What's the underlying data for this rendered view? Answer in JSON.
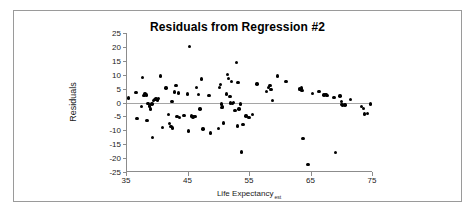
{
  "figure": {
    "title": "Residuals from Regression #2",
    "background": "#ffffff",
    "border_color": "#9a9a9a"
  },
  "chart_data": {
    "type": "scatter",
    "title": "Residuals from Regression #2",
    "xlabel": "Life Expectancy",
    "xlabel_subscript": "est",
    "ylabel": "Residuals",
    "xlim": [
      35,
      75
    ],
    "ylim": [
      -25,
      25
    ],
    "xticks": [
      35,
      45,
      55,
      65,
      75
    ],
    "yticks": [
      25,
      20,
      15,
      10,
      5,
      0,
      -5,
      -10,
      -15,
      -20,
      -25
    ],
    "xtick_labels": [
      "35",
      "45",
      "55",
      "65",
      "75"
    ],
    "ytick_labels": [
      "25",
      "20",
      "15",
      "10",
      "5",
      "0",
      "-5",
      "-10",
      "-15",
      "-20",
      "-25"
    ],
    "grid": false,
    "zero_line": true,
    "legend": null,
    "marker": "filled-circle",
    "marker_color": "#000000",
    "points": [
      [
        35.4,
        1.6
      ],
      [
        36.6,
        3.7
      ],
      [
        36.8,
        -5.8
      ],
      [
        37.5,
        -1.5
      ],
      [
        37.7,
        8.9
      ],
      [
        37.9,
        2.6
      ],
      [
        38.1,
        3.0
      ],
      [
        38.3,
        2.7
      ],
      [
        38.4,
        -6.4
      ],
      [
        38.6,
        -0.3
      ],
      [
        38.8,
        -1.2
      ],
      [
        39.0,
        -2.4
      ],
      [
        39.2,
        -0.6
      ],
      [
        39.3,
        -12.5
      ],
      [
        39.5,
        0.8
      ],
      [
        39.7,
        1.1
      ],
      [
        39.9,
        1.3
      ],
      [
        40.1,
        0.9
      ],
      [
        40.3,
        1.4
      ],
      [
        40.6,
        9.6
      ],
      [
        40.9,
        -8.9
      ],
      [
        41.5,
        5.2
      ],
      [
        41.9,
        -4.3
      ],
      [
        42.1,
        -7.6
      ],
      [
        42.3,
        -8.6
      ],
      [
        42.5,
        0.3
      ],
      [
        42.6,
        -9.1
      ],
      [
        42.9,
        3.8
      ],
      [
        43.1,
        6.2
      ],
      [
        43.3,
        -5.0
      ],
      [
        43.5,
        3.4
      ],
      [
        43.7,
        -5.4
      ],
      [
        44.4,
        -4.6
      ],
      [
        45.0,
        3.0
      ],
      [
        45.2,
        -10.3
      ],
      [
        45.3,
        20.2
      ],
      [
        45.6,
        -4.8
      ],
      [
        45.9,
        -5.2
      ],
      [
        46.2,
        -5.1
      ],
      [
        46.5,
        5.4
      ],
      [
        46.8,
        2.8
      ],
      [
        47.0,
        -2.4
      ],
      [
        47.3,
        8.4
      ],
      [
        47.5,
        -9.5
      ],
      [
        48.5,
        2.6
      ],
      [
        48.7,
        -11.0
      ],
      [
        50.0,
        -9.3
      ],
      [
        50.2,
        5.5
      ],
      [
        50.4,
        6.4
      ],
      [
        50.5,
        -0.5
      ],
      [
        50.6,
        -1.9
      ],
      [
        50.7,
        -1.4
      ],
      [
        50.9,
        -7.4
      ],
      [
        51.3,
        3.0
      ],
      [
        51.5,
        10.1
      ],
      [
        51.7,
        8.6
      ],
      [
        51.9,
        2.1
      ],
      [
        52.0,
        -0.2
      ],
      [
        52.2,
        7.6
      ],
      [
        52.3,
        -0.3
      ],
      [
        52.5,
        -0.1
      ],
      [
        52.7,
        -2.8
      ],
      [
        53.0,
        14.4
      ],
      [
        53.1,
        -8.4
      ],
      [
        53.2,
        7.1
      ],
      [
        53.4,
        -2.3
      ],
      [
        53.6,
        -0.6
      ],
      [
        53.8,
        -17.8
      ],
      [
        54.0,
        -8.0
      ],
      [
        54.5,
        -4.9
      ],
      [
        55.0,
        -5.4
      ],
      [
        55.6,
        -4.4
      ],
      [
        56.3,
        6.7
      ],
      [
        57.8,
        3.9
      ],
      [
        58.2,
        5.3
      ],
      [
        58.4,
        6.2
      ],
      [
        58.6,
        4.6
      ],
      [
        58.8,
        0.8
      ],
      [
        59.6,
        9.6
      ],
      [
        61.0,
        7.5
      ],
      [
        63.2,
        5.0
      ],
      [
        63.3,
        4.6
      ],
      [
        63.5,
        5.2
      ],
      [
        63.6,
        4.4
      ],
      [
        63.8,
        -12.9
      ],
      [
        64.6,
        -22.2
      ],
      [
        65.3,
        3.3
      ],
      [
        66.4,
        3.9
      ],
      [
        67.2,
        2.7
      ],
      [
        67.5,
        2.9
      ],
      [
        67.7,
        2.6
      ],
      [
        68.8,
        1.9
      ],
      [
        69.1,
        -18.0
      ],
      [
        69.8,
        2.4
      ],
      [
        70.0,
        0.3
      ],
      [
        70.1,
        -0.7
      ],
      [
        70.2,
        -1.0
      ],
      [
        70.6,
        -0.9
      ],
      [
        71.5,
        1.1
      ],
      [
        73.3,
        -1.5
      ],
      [
        73.6,
        -2.2
      ],
      [
        73.8,
        -4.1
      ],
      [
        74.3,
        -4.0
      ],
      [
        74.8,
        -0.6
      ]
    ]
  }
}
